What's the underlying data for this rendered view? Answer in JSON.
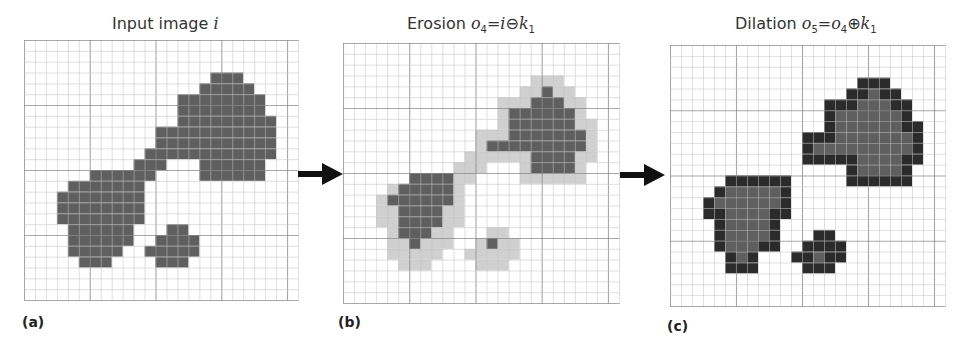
{
  "panels": [
    {
      "id": "a",
      "label": "(a)",
      "title_text": "Input image",
      "title_var": "i",
      "grid": {
        "x": 24,
        "y": 40,
        "w": 274,
        "h": 260,
        "cols": 25,
        "rows": 24
      },
      "colors": {
        "fill": "#5e5e5e",
        "light": "#cfcfcf",
        "border": "#2e2e2e"
      },
      "layers": {
        "fill": {
          "3": [
            [
              17,
              19
            ]
          ],
          "4": [
            [
              16,
              20
            ]
          ],
          "5": [
            [
              14,
              21
            ]
          ],
          "6": [
            [
              14,
              21
            ]
          ],
          "7": [
            [
              14,
              22
            ]
          ],
          "8": [
            [
              12,
              22
            ]
          ],
          "9": [
            [
              12,
              22
            ]
          ],
          "10": [
            [
              11,
              22
            ]
          ],
          "11": [
            [
              10,
              12
            ],
            [
              16,
              21
            ]
          ],
          "12": [
            [
              6,
              11
            ],
            [
              16,
              21
            ]
          ],
          "13": [
            [
              4,
              10
            ]
          ],
          "14": [
            [
              3,
              10
            ]
          ],
          "15": [
            [
              3,
              10
            ]
          ],
          "16": [
            [
              3,
              10
            ]
          ],
          "17": [
            [
              4,
              9
            ],
            [
              13,
              14
            ]
          ],
          "18": [
            [
              4,
              9
            ],
            [
              12,
              15
            ]
          ],
          "19": [
            [
              4,
              8
            ],
            [
              11,
              15
            ]
          ],
          "20": [
            [
              5,
              7
            ],
            [
              12,
              14
            ]
          ]
        }
      }
    },
    {
      "id": "b",
      "label": "(b)",
      "title_text": "Erosion",
      "title_formula": [
        "o",
        "4",
        "=",
        "i",
        "⊖",
        "k",
        "1"
      ],
      "grid": {
        "x": 343,
        "y": 43,
        "w": 276,
        "h": 260,
        "cols": 25,
        "rows": 24
      },
      "layers": {
        "light": {
          "3": [
            [
              17,
              19
            ]
          ],
          "4": [
            [
              16,
              20
            ]
          ],
          "5": [
            [
              14,
              21
            ]
          ],
          "6": [
            [
              14,
              21
            ]
          ],
          "7": [
            [
              14,
              22
            ]
          ],
          "8": [
            [
              12,
              22
            ]
          ],
          "9": [
            [
              12,
              22
            ]
          ],
          "10": [
            [
              11,
              22
            ]
          ],
          "11": [
            [
              10,
              12
            ],
            [
              16,
              21
            ]
          ],
          "12": [
            [
              6,
              11
            ],
            [
              16,
              21
            ]
          ],
          "13": [
            [
              4,
              10
            ]
          ],
          "14": [
            [
              3,
              10
            ]
          ],
          "15": [
            [
              3,
              10
            ]
          ],
          "16": [
            [
              3,
              10
            ]
          ],
          "17": [
            [
              4,
              9
            ],
            [
              13,
              14
            ]
          ],
          "18": [
            [
              4,
              9
            ],
            [
              12,
              15
            ]
          ],
          "19": [
            [
              4,
              8
            ],
            [
              11,
              15
            ]
          ],
          "20": [
            [
              5,
              7
            ],
            [
              12,
              14
            ]
          ]
        },
        "fill": {
          "4": [
            [
              18,
              18
            ]
          ],
          "5": [
            [
              17,
              19
            ]
          ],
          "6": [
            [
              15,
              20
            ]
          ],
          "7": [
            [
              15,
              20
            ]
          ],
          "8": [
            [
              15,
              21
            ]
          ],
          "9": [
            [
              13,
              21
            ]
          ],
          "10": [
            [
              17,
              20
            ]
          ],
          "11": [
            [
              17,
              20
            ]
          ],
          "12": [
            [
              6,
              9
            ]
          ],
          "13": [
            [
              5,
              9
            ]
          ],
          "14": [
            [
              4,
              9
            ]
          ],
          "15": [
            [
              5,
              8
            ]
          ],
          "16": [
            [
              5,
              8
            ]
          ],
          "17": [
            [
              5,
              7
            ]
          ],
          "18": [
            [
              6,
              6
            ],
            [
              13,
              13
            ]
          ]
        }
      }
    },
    {
      "id": "c",
      "label": "(c)",
      "title_text": "Dilation",
      "title_formula": [
        "o",
        "5",
        "=",
        "o",
        "4",
        "⊕",
        "k",
        "1"
      ],
      "grid": {
        "x": 670,
        "y": 45,
        "w": 275,
        "h": 261,
        "cols": 25,
        "rows": 24
      },
      "layers": {
        "border": {
          "3": [
            [
              17,
              19
            ]
          ],
          "4": [
            [
              16,
              20
            ]
          ],
          "5": [
            [
              14,
              21
            ]
          ],
          "6": [
            [
              14,
              21
            ]
          ],
          "7": [
            [
              14,
              22
            ]
          ],
          "8": [
            [
              12,
              22
            ]
          ],
          "9": [
            [
              12,
              22
            ]
          ],
          "10": [
            [
              12,
              22
            ]
          ],
          "11": [
            [
              16,
              21
            ]
          ],
          "12": [
            [
              5,
              10
            ],
            [
              16,
              21
            ]
          ],
          "13": [
            [
              4,
              10
            ]
          ],
          "14": [
            [
              3,
              10
            ]
          ],
          "15": [
            [
              3,
              10
            ]
          ],
          "16": [
            [
              4,
              9
            ]
          ],
          "17": [
            [
              4,
              9
            ],
            [
              13,
              14
            ]
          ],
          "18": [
            [
              4,
              9
            ],
            [
              12,
              15
            ]
          ],
          "19": [
            [
              5,
              7
            ],
            [
              11,
              15
            ]
          ],
          "20": [
            [
              5,
              7
            ],
            [
              12,
              14
            ]
          ]
        },
        "fill": {
          "4": [
            [
              18,
              18
            ]
          ],
          "5": [
            [
              17,
              19
            ]
          ],
          "6": [
            [
              15,
              20
            ]
          ],
          "7": [
            [
              15,
              20
            ]
          ],
          "8": [
            [
              15,
              21
            ]
          ],
          "9": [
            [
              13,
              21
            ]
          ],
          "10": [
            [
              17,
              20
            ]
          ],
          "11": [
            [
              17,
              20
            ]
          ],
          "13": [
            [
              5,
              9
            ]
          ],
          "14": [
            [
              4,
              9
            ]
          ],
          "15": [
            [
              5,
              8
            ]
          ],
          "16": [
            [
              5,
              8
            ]
          ],
          "17": [
            [
              5,
              8
            ]
          ],
          "18": [
            [
              5,
              7
            ]
          ],
          "19": [
            [
              6,
              6
            ],
            [
              13,
              13
            ]
          ]
        }
      }
    }
  ],
  "arrows": [
    {
      "from": "a",
      "to": "b",
      "x": 298,
      "y": 173
    },
    {
      "from": "b",
      "to": "c",
      "x": 620,
      "y": 174
    }
  ],
  "colors": {
    "grid_line": "#c4c4c4",
    "grid_major": "#8a8a8a",
    "fill": "#5f5f5f",
    "light": "#d0d0d0",
    "border": "#2b2b2b",
    "arrow": "#111111"
  }
}
